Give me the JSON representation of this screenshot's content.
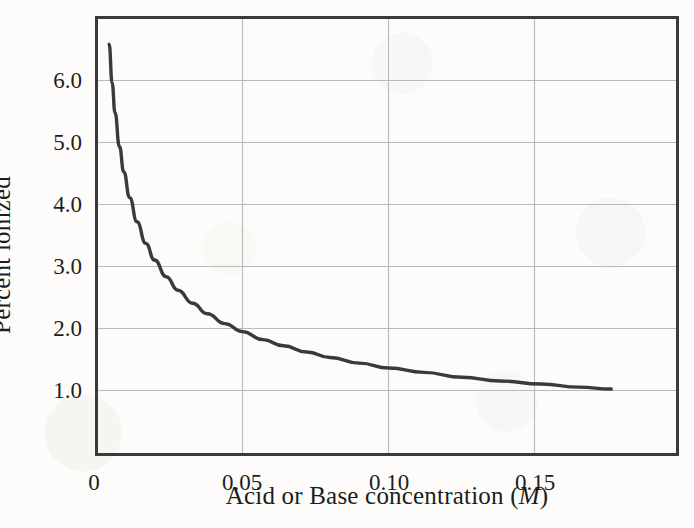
{
  "figure": {
    "background_color": "#fdfcfa",
    "frame_color": "#3a3a3a",
    "grid_color": "#b9b9b9",
    "curve_color": "#3a3a3a"
  },
  "chart_data": {
    "type": "line",
    "title": "",
    "xlabel_prefix": "Acid or Base concentration (",
    "xlabel_unit": "M",
    "xlabel_suffix": ")",
    "xlabel": "Acid or Base concentration (M)",
    "ylabel": "Percent ionized",
    "xlim": [
      0,
      0.1988
    ],
    "ylim": [
      0.0,
      7.1
    ],
    "xticks": [
      0,
      0.05,
      0.1,
      0.15
    ],
    "xtick_labels": [
      "0",
      "0.05",
      "0.10",
      "0.15"
    ],
    "yticks": [
      1.0,
      2.0,
      3.0,
      4.0,
      5.0,
      6.0
    ],
    "ytick_labels": [
      "1.0",
      "2.0",
      "3.0",
      "4.0",
      "5.0",
      "6.0"
    ],
    "grid": true,
    "grid_axes": "both",
    "legend": false,
    "series": [
      {
        "name": "Percent ionized vs concentration",
        "relation": "percent = 0.447 / sqrt(concentration)",
        "x": [
          0.0045,
          0.0055,
          0.0065,
          0.008,
          0.0095,
          0.0115,
          0.014,
          0.017,
          0.02,
          0.024,
          0.028,
          0.033,
          0.038,
          0.044,
          0.05,
          0.057,
          0.064,
          0.072,
          0.08,
          0.09,
          0.1,
          0.112,
          0.125,
          0.138,
          0.152,
          0.165,
          0.176
        ],
        "y": [
          6.66,
          6.03,
          5.55,
          5.0,
          4.59,
          4.17,
          3.78,
          3.43,
          3.16,
          2.89,
          2.67,
          2.46,
          2.29,
          2.13,
          2.0,
          1.87,
          1.77,
          1.67,
          1.58,
          1.49,
          1.41,
          1.34,
          1.26,
          1.2,
          1.15,
          1.1,
          1.07
        ]
      }
    ]
  },
  "axis_geometry": {
    "plot_left": 96,
    "plot_right": 678,
    "plot_top": 17,
    "plot_bottom": 455
  }
}
